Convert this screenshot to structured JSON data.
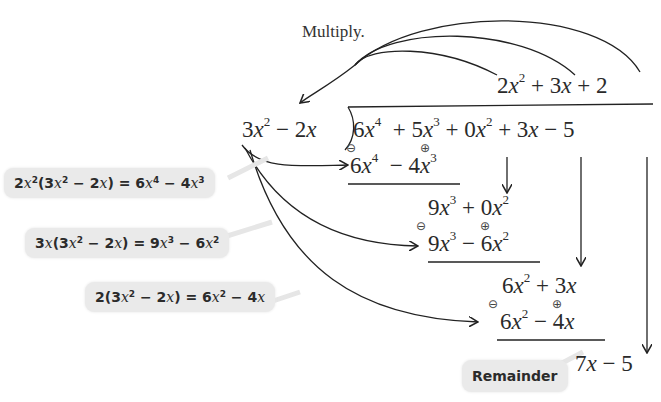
{
  "diagram": {
    "multiply_label": "Multiply.",
    "quotient": {
      "terms": [
        "2x²",
        "+",
        "3x",
        "+",
        "2"
      ]
    },
    "divisor": "3x² − 2x",
    "dividend": {
      "terms": [
        "6x⁴",
        "+",
        "5x³",
        "+",
        "0x²",
        "+",
        "3x",
        "−",
        "5"
      ]
    },
    "steps": [
      {
        "subtract": "6x⁴ − 4x³",
        "sign_markers": [
          "⊖",
          "⊕"
        ],
        "result": "9x³ + 0x²"
      },
      {
        "subtract": "9x³ − 6x²",
        "sign_markers": [
          "⊖",
          "⊕"
        ],
        "result": "6x² + 3x"
      },
      {
        "subtract": "6x² − 4x",
        "sign_markers": [
          "⊖",
          "⊕"
        ],
        "result": "7x − 5"
      }
    ],
    "callouts": [
      {
        "text": "2x²(3x² − 2x) = 6x⁴ − 4x³"
      },
      {
        "text": "3x(3x² − 2x) = 9x³ − 6x²"
      },
      {
        "text": "2(3x² − 2x) = 6x² − 4x"
      }
    ],
    "remainder_label": "Remainder",
    "remainder_value": "7x − 5",
    "colors": {
      "ink": "#2a2a2a",
      "callout_bg": "#eaeaea"
    }
  }
}
